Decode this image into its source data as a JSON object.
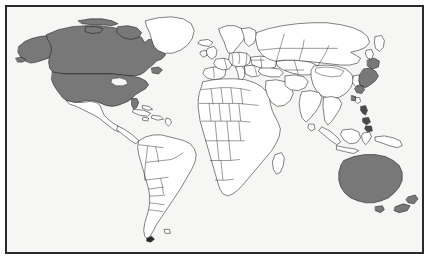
{
  "figure": {
    "kind": "world-map",
    "title": "World map with highlighted countries",
    "projection": "equirectangular",
    "frame": {
      "border_color": "#2a2a2a",
      "border_width_px": 2,
      "inset_px": 5
    },
    "colors": {
      "canvas_background": "#ffffff",
      "map_background": "#f6f6f5",
      "land_fill": "#ffffff",
      "land_outline": "#1b1b1b",
      "highlight_fill": "#787878"
    },
    "legend_visible": false,
    "labels_visible": false,
    "graticule_visible": false
  },
  "regions": {
    "highlighted": [
      {
        "id": "united-states",
        "label": "United States"
      },
      {
        "id": "canada",
        "label": "Canada"
      },
      {
        "id": "japan",
        "label": "Japan"
      },
      {
        "id": "australia",
        "label": "Australia"
      },
      {
        "id": "new-zealand",
        "label": "New Zealand"
      }
    ],
    "unhighlighted_examples": [
      {
        "id": "greenland",
        "label": "Greenland"
      },
      {
        "id": "mexico",
        "label": "Mexico"
      },
      {
        "id": "south-america",
        "label": "South America"
      },
      {
        "id": "africa",
        "label": "Africa"
      },
      {
        "id": "europe",
        "label": "Europe"
      },
      {
        "id": "asia-mainland",
        "label": "Asia (mainland)"
      }
    ]
  }
}
